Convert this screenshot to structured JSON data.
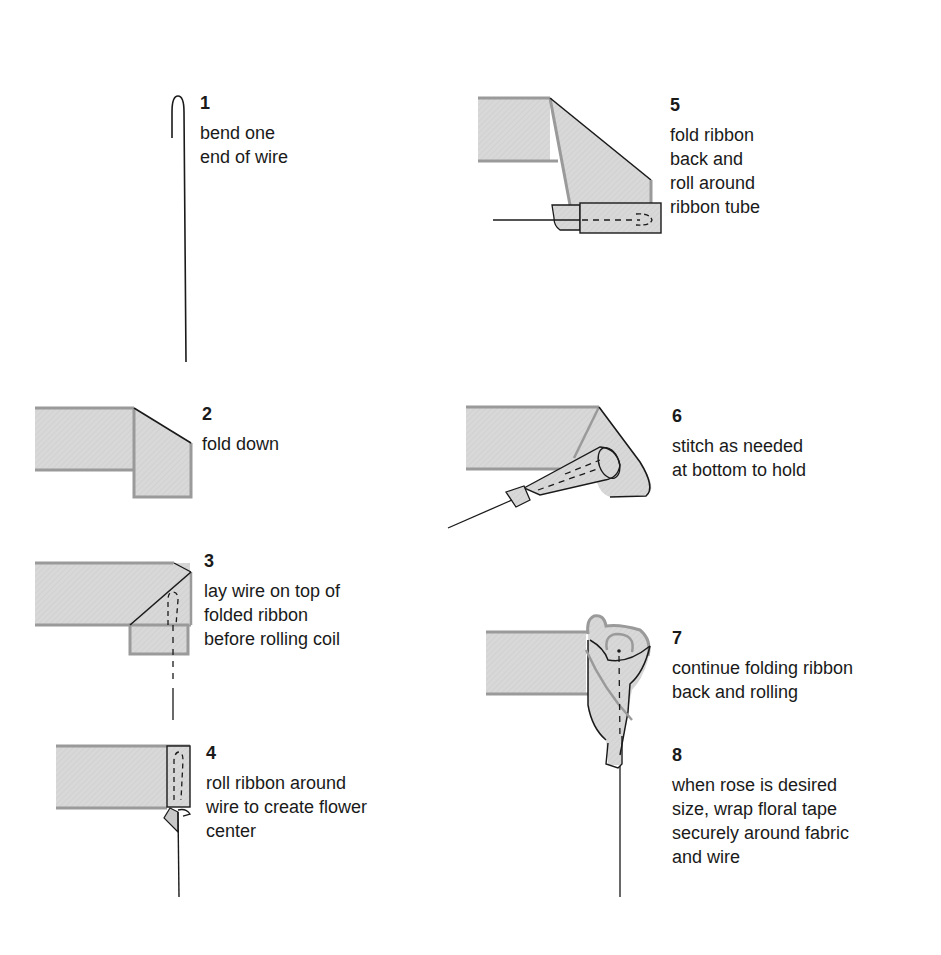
{
  "diagram": {
    "colors": {
      "ribbon_fill": "#d6d6d6",
      "ribbon_edge": "#9a9a9a",
      "outline": "#1a1a1a",
      "background": "#ffffff"
    },
    "steps": [
      {
        "number": "1",
        "text": "bend one\nend of wire"
      },
      {
        "number": "2",
        "text": "fold down"
      },
      {
        "number": "3",
        "text": "lay wire on top of\nfolded ribbon\nbefore rolling coil"
      },
      {
        "number": "4",
        "text": "roll ribbon around\nwire to create flower\ncenter"
      },
      {
        "number": "5",
        "text": "fold ribbon\nback and\nroll around\nribbon tube"
      },
      {
        "number": "6",
        "text": "stitch as needed\nat bottom to hold"
      },
      {
        "number": "7",
        "text": "continue folding ribbon\nback and rolling"
      },
      {
        "number": "8",
        "text": "when rose is desired\nsize, wrap floral tape\nsecurely around fabric\nand wire"
      }
    ]
  }
}
